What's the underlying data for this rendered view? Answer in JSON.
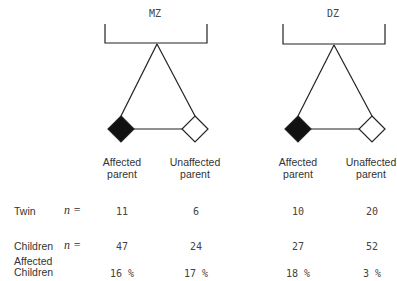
{
  "groups": [
    {
      "title": "MZ",
      "left_label": "Affected parent",
      "right_label": "Unaffected parent"
    },
    {
      "title": "DZ",
      "left_label": "Affected parent",
      "right_label": "Unaffected parent"
    }
  ],
  "labels": {
    "left_line1": "Affected",
    "left_line2": "parent",
    "right_line1": "Unaffected",
    "right_line2": "parent"
  },
  "rows": [
    {
      "label": "Twin",
      "n": "n =",
      "values": [
        "11",
        "6",
        "10",
        "20"
      ]
    },
    {
      "label": "Children",
      "n": "n =",
      "values": [
        "47",
        "24",
        "27",
        "52"
      ]
    },
    {
      "label_line1": "Affected",
      "label_line2": "Children",
      "values": [
        "16 %",
        "17 %",
        "18 %",
        "3 %"
      ]
    }
  ],
  "colors": {
    "line": "#222222",
    "affected_fill": "#111111",
    "unaffected_fill": "#ffffff"
  }
}
